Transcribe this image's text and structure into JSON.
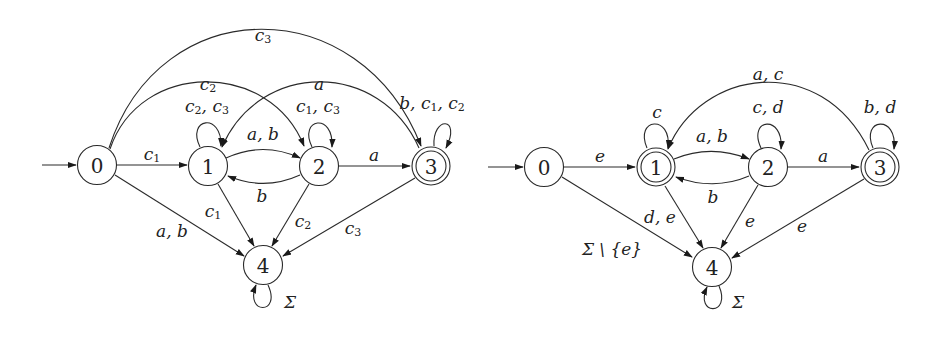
{
  "diagrams": [
    {
      "id": "left",
      "initial_state": "0",
      "accepting_states": [
        "3"
      ],
      "states": [
        {
          "id": "0",
          "label": "0",
          "x": 97,
          "y": 165
        },
        {
          "id": "1",
          "label": "1",
          "x": 208,
          "y": 166
        },
        {
          "id": "2",
          "label": "2",
          "x": 319,
          "y": 166
        },
        {
          "id": "3",
          "label": "3",
          "x": 431,
          "y": 166
        },
        {
          "id": "4",
          "label": "4",
          "x": 263,
          "y": 265
        }
      ],
      "labels": {
        "e01": "c1",
        "e01_main": "c",
        "e01_sub": "1",
        "e02_main": "c",
        "e02_sub": "2",
        "e03_main": "c",
        "e03_sub": "3",
        "e04": "a, b",
        "e11": "c2, c3",
        "e11_a": "c",
        "e11_a_sub": "2",
        "e11_b": "c",
        "e11_b_sub": "3",
        "e12": "a, b",
        "e21": "b",
        "e22": "c1, c3",
        "e22_a": "c",
        "e22_a_sub": "1",
        "e22_b": "c",
        "e22_b_sub": "3",
        "e23": "a",
        "e31": "a",
        "e33": "b, c1, c2",
        "e33_b": "b",
        "e33_a": "c",
        "e33_a_sub": "1",
        "e33_c": "c",
        "e33_c_sub": "2",
        "e14_main": "c",
        "e14_sub": "1",
        "e24_main": "c",
        "e24_sub": "2",
        "e34_main": "c",
        "e34_sub": "3",
        "e44": "Σ"
      },
      "transitions": [
        {
          "from": "0",
          "to": "1",
          "label": "c1"
        },
        {
          "from": "0",
          "to": "2",
          "label": "c2"
        },
        {
          "from": "0",
          "to": "3",
          "label": "c3"
        },
        {
          "from": "0",
          "to": "4",
          "label": "a, b"
        },
        {
          "from": "1",
          "to": "1",
          "label": "c2, c3"
        },
        {
          "from": "1",
          "to": "2",
          "label": "a, b"
        },
        {
          "from": "1",
          "to": "4",
          "label": "c1"
        },
        {
          "from": "2",
          "to": "1",
          "label": "b"
        },
        {
          "from": "2",
          "to": "2",
          "label": "c1, c3"
        },
        {
          "from": "2",
          "to": "3",
          "label": "a"
        },
        {
          "from": "2",
          "to": "4",
          "label": "c2"
        },
        {
          "from": "3",
          "to": "1",
          "label": "a"
        },
        {
          "from": "3",
          "to": "3",
          "label": "b, c1, c2"
        },
        {
          "from": "3",
          "to": "4",
          "label": "c3"
        },
        {
          "from": "4",
          "to": "4",
          "label": "Σ"
        }
      ]
    },
    {
      "id": "right",
      "initial_state": "0",
      "accepting_states": [
        "1",
        "3"
      ],
      "states": [
        {
          "id": "0",
          "label": "0",
          "x": 544,
          "y": 167
        },
        {
          "id": "1",
          "label": "1",
          "x": 656,
          "y": 167
        },
        {
          "id": "2",
          "label": "2",
          "x": 768,
          "y": 167
        },
        {
          "id": "3",
          "label": "3",
          "x": 880,
          "y": 167
        },
        {
          "id": "4",
          "label": "4",
          "x": 712,
          "y": 267
        }
      ],
      "labels": {
        "e01": "e",
        "e04": "Σ \\ {e}",
        "e11": "c",
        "e12": "a, b",
        "e14": "d, e",
        "e21": "b",
        "e22": "c, d",
        "e23": "a",
        "e24": "e",
        "e31": "a, c",
        "e33": "b, d",
        "e34": "e",
        "e44": "Σ"
      },
      "transitions": [
        {
          "from": "0",
          "to": "1",
          "label": "e"
        },
        {
          "from": "0",
          "to": "4",
          "label": "Σ \\ {e}"
        },
        {
          "from": "1",
          "to": "1",
          "label": "c"
        },
        {
          "from": "1",
          "to": "2",
          "label": "a, b"
        },
        {
          "from": "1",
          "to": "4",
          "label": "d, e"
        },
        {
          "from": "2",
          "to": "1",
          "label": "b"
        },
        {
          "from": "2",
          "to": "2",
          "label": "c, d"
        },
        {
          "from": "2",
          "to": "3",
          "label": "a"
        },
        {
          "from": "2",
          "to": "4",
          "label": "e"
        },
        {
          "from": "3",
          "to": "1",
          "label": "a, c"
        },
        {
          "from": "3",
          "to": "3",
          "label": "b, d"
        },
        {
          "from": "3",
          "to": "4",
          "label": "e"
        },
        {
          "from": "4",
          "to": "4",
          "label": "Σ"
        }
      ]
    }
  ]
}
